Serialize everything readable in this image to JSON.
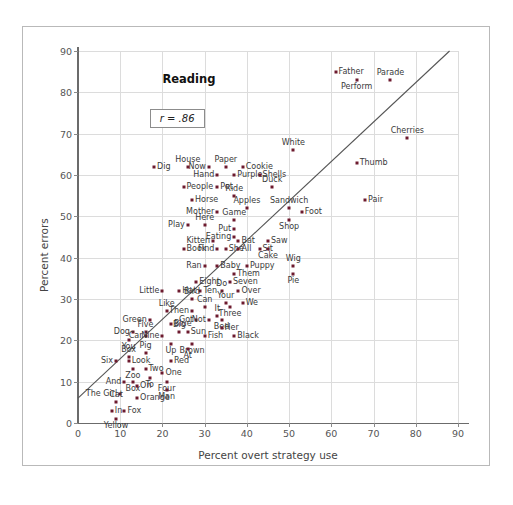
{
  "chart_data": {
    "type": "scatter",
    "title": "Reading",
    "annotation": "r = .86",
    "xlabel": "Percent overt strategy use",
    "ylabel": "Percent errors",
    "xlim": [
      0,
      90
    ],
    "ylim": [
      0,
      90
    ],
    "xticks": [
      0,
      10,
      20,
      30,
      40,
      50,
      60,
      70,
      80,
      90
    ],
    "yticks": [
      0,
      10,
      20,
      30,
      40,
      50,
      60,
      70,
      80,
      90
    ],
    "grid": true,
    "legend": null,
    "point_color": "#6d1a2e",
    "trendline": {
      "x0": 0,
      "y0": 6,
      "x1": 88,
      "y1": 90,
      "color": "#555555"
    },
    "points": [
      {
        "label": "Father",
        "x": 61,
        "y": 85,
        "pos": "r"
      },
      {
        "label": "Perform",
        "x": 66,
        "y": 83,
        "pos": "b"
      },
      {
        "label": "Parade",
        "x": 74,
        "y": 83,
        "pos": "t"
      },
      {
        "label": "Cherries",
        "x": 78,
        "y": 69,
        "pos": "t"
      },
      {
        "label": "White",
        "x": 51,
        "y": 66,
        "pos": "t"
      },
      {
        "label": "Thumb",
        "x": 66,
        "y": 63,
        "pos": "r"
      },
      {
        "label": "Dig",
        "x": 18,
        "y": 62,
        "pos": "r"
      },
      {
        "label": "House",
        "x": 26,
        "y": 62,
        "pos": "t"
      },
      {
        "label": "Now",
        "x": 31,
        "y": 62,
        "pos": "l"
      },
      {
        "label": "Paper",
        "x": 35,
        "y": 62,
        "pos": "t"
      },
      {
        "label": "Cookie",
        "x": 39,
        "y": 62,
        "pos": "r"
      },
      {
        "label": "Hand",
        "x": 33,
        "y": 60,
        "pos": "l"
      },
      {
        "label": "Purple",
        "x": 37,
        "y": 60,
        "pos": "r"
      },
      {
        "label": "Shells",
        "x": 43,
        "y": 60,
        "pos": "r"
      },
      {
        "label": "People",
        "x": 25,
        "y": 57,
        "pos": "r"
      },
      {
        "label": "Pet",
        "x": 33,
        "y": 57,
        "pos": "r"
      },
      {
        "label": "Duck",
        "x": 46,
        "y": 57,
        "pos": "t"
      },
      {
        "label": "Pair",
        "x": 68,
        "y": 54,
        "pos": "r"
      },
      {
        "label": "Horse",
        "x": 27,
        "y": 54,
        "pos": "r"
      },
      {
        "label": "Ride",
        "x": 37,
        "y": 55,
        "pos": "t"
      },
      {
        "label": "Apples",
        "x": 40,
        "y": 52,
        "pos": "t"
      },
      {
        "label": "Sandwich",
        "x": 50,
        "y": 52,
        "pos": "t"
      },
      {
        "label": "Mother",
        "x": 33,
        "y": 51,
        "pos": "l"
      },
      {
        "label": "Foot",
        "x": 53,
        "y": 51,
        "pos": "r"
      },
      {
        "label": "Shop",
        "x": 50,
        "y": 49,
        "pos": "b"
      },
      {
        "label": "Here",
        "x": 30,
        "y": 48,
        "pos": "t"
      },
      {
        "label": "Game",
        "x": 37,
        "y": 49,
        "pos": "t"
      },
      {
        "label": "Put",
        "x": 37,
        "y": 47,
        "pos": "l"
      },
      {
        "label": "Play",
        "x": 26,
        "y": 48,
        "pos": "l"
      },
      {
        "label": "Eating",
        "x": 37,
        "y": 45,
        "pos": "l"
      },
      {
        "label": "Saw",
        "x": 45,
        "y": 44,
        "pos": "r"
      },
      {
        "label": "Bat",
        "x": 38,
        "y": 44,
        "pos": "r"
      },
      {
        "label": "Kitten",
        "x": 32,
        "y": 44,
        "pos": "l"
      },
      {
        "label": "Sit",
        "x": 43,
        "y": 42,
        "pos": "r"
      },
      {
        "label": "Cake",
        "x": 45,
        "y": 42,
        "pos": "b"
      },
      {
        "label": "Find",
        "x": 33,
        "y": 42,
        "pos": "l"
      },
      {
        "label": "She",
        "x": 35,
        "y": 42,
        "pos": "r"
      },
      {
        "label": "All",
        "x": 38,
        "y": 42,
        "pos": "r"
      },
      {
        "label": "Book",
        "x": 25,
        "y": 42,
        "pos": "r"
      },
      {
        "label": "Wig",
        "x": 51,
        "y": 38,
        "pos": "t"
      },
      {
        "label": "Pie",
        "x": 51,
        "y": 36,
        "pos": "b"
      },
      {
        "label": "Ran",
        "x": 30,
        "y": 38,
        "pos": "l"
      },
      {
        "label": "Baby",
        "x": 33,
        "y": 38,
        "pos": "r"
      },
      {
        "label": "Puppy",
        "x": 40,
        "y": 38,
        "pos": "r"
      },
      {
        "label": "Them",
        "x": 37,
        "y": 36,
        "pos": "r"
      },
      {
        "label": "Eight",
        "x": 28,
        "y": 34,
        "pos": "r"
      },
      {
        "label": "Seven",
        "x": 36,
        "y": 34,
        "pos": "r"
      },
      {
        "label": "Little",
        "x": 20,
        "y": 32,
        "pos": "l"
      },
      {
        "label": "Hat",
        "x": 24,
        "y": 32,
        "pos": "r"
      },
      {
        "label": "Ten",
        "x": 29,
        "y": 32,
        "pos": "r"
      },
      {
        "label": "Do",
        "x": 34,
        "y": 32,
        "pos": "t"
      },
      {
        "label": "Over",
        "x": 38,
        "y": 32,
        "pos": "r"
      },
      {
        "label": "Bird",
        "x": 27,
        "y": 30,
        "pos": "t"
      },
      {
        "label": "Your",
        "x": 35,
        "y": 29,
        "pos": "t"
      },
      {
        "label": "Three",
        "x": 36,
        "y": 28,
        "pos": "b"
      },
      {
        "label": "We",
        "x": 39,
        "y": 29,
        "pos": "r"
      },
      {
        "label": "Like",
        "x": 21,
        "y": 27,
        "pos": "t"
      },
      {
        "label": "Can",
        "x": 30,
        "y": 28,
        "pos": "t"
      },
      {
        "label": "Then",
        "x": 27,
        "y": 27,
        "pos": "l"
      },
      {
        "label": "It",
        "x": 33,
        "y": 26,
        "pos": "t"
      },
      {
        "label": "Got",
        "x": 28,
        "y": 25,
        "pos": "l"
      },
      {
        "label": "Not",
        "x": 31,
        "y": 25,
        "pos": "l"
      },
      {
        "label": "Bed",
        "x": 34,
        "y": 25,
        "pos": "b"
      },
      {
        "label": "Green",
        "x": 17,
        "y": 25,
        "pos": "l"
      },
      {
        "label": "Blue",
        "x": 22,
        "y": 24,
        "pos": "r"
      },
      {
        "label": "Her",
        "x": 34,
        "y": 23,
        "pos": "r"
      },
      {
        "label": "Big",
        "x": 24,
        "y": 22,
        "pos": "t"
      },
      {
        "label": "Sun",
        "x": 26,
        "y": 22,
        "pos": "r"
      },
      {
        "label": "Five",
        "x": 16,
        "y": 22,
        "pos": "t"
      },
      {
        "label": "Dog",
        "x": 13,
        "y": 22,
        "pos": "l"
      },
      {
        "label": "Fish",
        "x": 30,
        "y": 21,
        "pos": "r"
      },
      {
        "label": "Black",
        "x": 37,
        "y": 21,
        "pos": "r"
      },
      {
        "label": "Car",
        "x": 16,
        "y": 21,
        "pos": "l"
      },
      {
        "label": "Nine",
        "x": 20,
        "y": 21,
        "pos": "l"
      },
      {
        "label": "You",
        "x": 12,
        "y": 20,
        "pos": "b"
      },
      {
        "label": "Up",
        "x": 22,
        "y": 19,
        "pos": "b"
      },
      {
        "label": "Brown",
        "x": 27,
        "y": 19,
        "pos": "b"
      },
      {
        "label": "At",
        "x": 26,
        "y": 18,
        "pos": "b"
      },
      {
        "label": "Six",
        "x": 9,
        "y": 15,
        "pos": "l"
      },
      {
        "label": "Box",
        "x": 12,
        "y": 16,
        "pos": "t"
      },
      {
        "label": "Look",
        "x": 12,
        "y": 15,
        "pos": "r"
      },
      {
        "label": "Pig",
        "x": 16,
        "y": 17,
        "pos": "t"
      },
      {
        "label": "Red",
        "x": 22,
        "y": 15,
        "pos": "r"
      },
      {
        "label": "Zoo",
        "x": 13,
        "y": 13,
        "pos": "b"
      },
      {
        "label": "Two",
        "x": 16,
        "y": 13,
        "pos": "r"
      },
      {
        "label": "One",
        "x": 20,
        "y": 12,
        "pos": "r"
      },
      {
        "label": "To",
        "x": 17,
        "y": 11,
        "pos": "b"
      },
      {
        "label": "And",
        "x": 11,
        "y": 10,
        "pos": "l"
      },
      {
        "label": "Box ",
        "x": 13,
        "y": 10,
        "pos": "b"
      },
      {
        "label": "Four",
        "x": 21,
        "y": 10,
        "pos": "b"
      },
      {
        "label": "On",
        "x": 14,
        "y": 9,
        "pos": "r"
      },
      {
        "label": "Man",
        "x": 21,
        "y": 8,
        "pos": "b"
      },
      {
        "label": "The Girl",
        "x": 10,
        "y": 7,
        "pos": "l"
      },
      {
        "label": "Orange",
        "x": 14,
        "y": 6,
        "pos": "r"
      },
      {
        "label": "Cat",
        "x": 9,
        "y": 5,
        "pos": "t"
      },
      {
        "label": "In",
        "x": 8,
        "y": 3,
        "pos": "r"
      },
      {
        "label": "Fox",
        "x": 11,
        "y": 3,
        "pos": "r"
      },
      {
        "label": "Yellow",
        "x": 9,
        "y": 1,
        "pos": "b"
      }
    ]
  }
}
